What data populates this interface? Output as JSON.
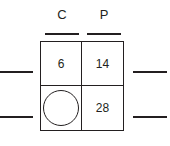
{
  "worksheet": {
    "type": "two-column-table-with-blanks",
    "columns": [
      {
        "header": "C"
      },
      {
        "header": "P"
      }
    ],
    "rows": [
      {
        "left_blank": "",
        "cells": [
          {
            "value": "6",
            "kind": "number"
          },
          {
            "value": "14",
            "kind": "number"
          }
        ],
        "right_blank": ""
      },
      {
        "left_blank": "",
        "cells": [
          {
            "value": "",
            "kind": "circle-placeholder"
          },
          {
            "value": "28",
            "kind": "number"
          }
        ],
        "right_blank": ""
      }
    ],
    "colors": {
      "ink": "#231f20",
      "background": "#ffffff"
    }
  }
}
